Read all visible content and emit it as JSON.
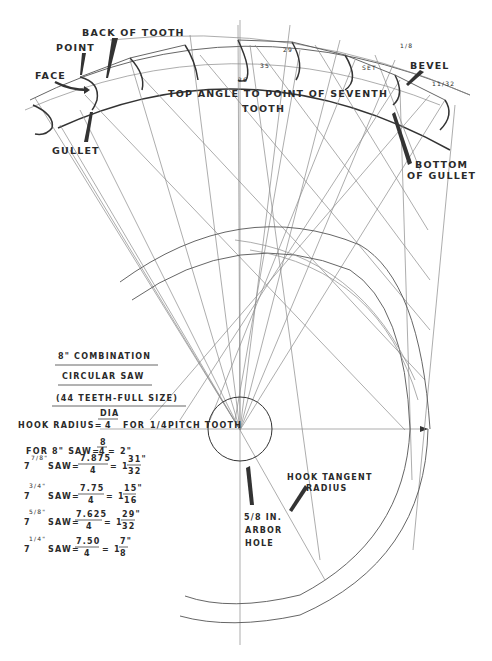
{
  "title_block": {
    "line1": "8\" COMBINATION",
    "line2": "CIRCULAR SAW",
    "line3": "(44 TEETH-FULL SIZE)"
  },
  "formula": {
    "prefix": "HOOK RADIUS=",
    "numerator": "DIA",
    "denominator": "4",
    "suffix": "FOR",
    "pitch_frac": "1/4",
    "pitch_text": "PITCH TOOTH"
  },
  "calculations": [
    {
      "size": "8\"",
      "label": "FOR 8\" SAW=",
      "numerator": "8",
      "denominator": "4",
      "result": "= 2\""
    },
    {
      "size_whole": "7",
      "size_frac": "7/8\"",
      "label": "SAW=",
      "numerator": "7.875",
      "denominator": "4",
      "result_whole": "= 1",
      "result_frac_num": "31\"",
      "result_frac_den": "32"
    },
    {
      "size_whole": "7",
      "size_frac": "3/4\"",
      "label": "SAW=",
      "numerator": "7.75",
      "denominator": "4",
      "result_whole": "= 1",
      "result_frac_num": "15\"",
      "result_frac_den": "16"
    },
    {
      "size_whole": "7",
      "size_frac": "5/8\"",
      "label": "SAW=",
      "numerator": "7.625",
      "denominator": "4",
      "result_whole": "= 1",
      "result_frac_num": "29\"",
      "result_frac_den": "32"
    },
    {
      "size_whole": "7",
      "size_frac": "1/4\"",
      "label": "SAW=",
      "numerator": "7.50",
      "denominator": "4",
      "result_whole": "= 1",
      "result_frac_num": "7\"",
      "result_frac_den": "8"
    }
  ],
  "labels": {
    "back_of_tooth": "BACK OF TOOTH",
    "point": "POINT",
    "face": "FACE",
    "gullet": "GULLET",
    "top_angle_1": "TOP ANGLE TO POINT OF SEVENTH",
    "top_angle_2": "TOOTH",
    "bevel": "BEVEL",
    "bottom_of_gullet_1": "BOTTOM",
    "bottom_of_gullet_2": "OF GULLET",
    "hook_tangent_1": "HOOK TANGENT",
    "hook_tangent_2": "RADIUS",
    "arbor_1": "5/8 IN.",
    "arbor_2": "ARBOR",
    "arbor_3": "HOLE"
  },
  "dimensions": {
    "d29": "29",
    "d35": "35",
    "d26": "26",
    "set": "SET",
    "eighth": "1/8",
    "bevel_dim": "11/32"
  },
  "colors": {
    "ink": "#2a2a2a",
    "line_light": "#8a8a8a",
    "paper": "#ffffff"
  }
}
